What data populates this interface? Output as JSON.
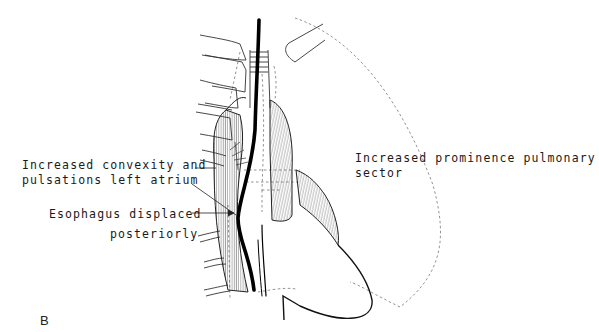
{
  "figure": {
    "panel_label": "B",
    "labels": {
      "left_atrium_line1": "Increased convexity and",
      "left_atrium_line2": "pulsations left atrium",
      "esophagus_line1": "Esophagus displaced",
      "esophagus_line2": "posteriorly",
      "pulmonary_line1": "Increased prominence pulmonary",
      "pulmonary_line2": "sector"
    },
    "colors": {
      "ink": "#111111",
      "dashed": "#777777",
      "background": "#ffffff"
    }
  }
}
